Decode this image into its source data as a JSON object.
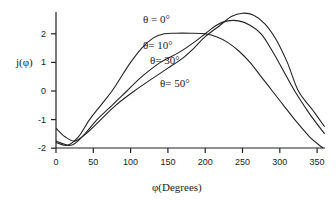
{
  "chart_data": {
    "type": "line",
    "title": "",
    "xlabel": "φ(Degrees)",
    "ylabel": "j(φ)",
    "xlim": [
      0,
      360
    ],
    "ylim": [
      -2,
      2.8
    ],
    "x_ticks": [
      0,
      50,
      100,
      150,
      200,
      250,
      300,
      350
    ],
    "y_ticks": [
      -2,
      -1,
      0,
      1,
      2
    ],
    "grid": false,
    "legend": "inline labels",
    "series": [
      {
        "name": "θ = 0°",
        "label_pos": [
          143,
          23
        ],
        "x": [
          0,
          15,
          30,
          45,
          60,
          75,
          90,
          100,
          115,
          130,
          145,
          160,
          180,
          200,
          215,
          230,
          245,
          260,
          275,
          290,
          305,
          320,
          340,
          358
        ],
        "values": [
          -1.8,
          -1.9,
          -1.6,
          -1.0,
          -0.5,
          0.0,
          0.6,
          1.0,
          1.5,
          1.85,
          2.0,
          2.02,
          2.02,
          2.0,
          1.9,
          1.7,
          1.4,
          1.0,
          0.5,
          0.0,
          -0.5,
          -1.0,
          -1.6,
          -2.0
        ]
      },
      {
        "name": "θ= 10°",
        "label_pos": [
          143,
          49
        ],
        "x": [
          0,
          20,
          35,
          55,
          75,
          95,
          115,
          140,
          165,
          185,
          200,
          215,
          230,
          245,
          260,
          275,
          290,
          305,
          320,
          340,
          360
        ],
        "values": [
          -1.75,
          -1.9,
          -1.6,
          -1.0,
          -0.5,
          0.0,
          0.5,
          1.0,
          1.35,
          1.7,
          2.0,
          2.3,
          2.45,
          2.45,
          2.3,
          2.0,
          1.4,
          0.7,
          0.0,
          -0.8,
          -1.5
        ]
      },
      {
        "name": "θ= 30°",
        "label_pos": [
          150,
          64
        ],
        "x": [],
        "values": []
      },
      {
        "name": "θ= 50°",
        "label_pos": [
          160,
          87
        ],
        "x": [
          0,
          12,
          25,
          40,
          60,
          80,
          105,
          130,
          150,
          170,
          185,
          200,
          220,
          235,
          250,
          265,
          280,
          295,
          310,
          325,
          345,
          360
        ],
        "values": [
          -1.3,
          -1.6,
          -1.75,
          -1.5,
          -1.0,
          -0.5,
          0.0,
          0.45,
          0.8,
          1.15,
          1.5,
          1.9,
          2.3,
          2.6,
          2.72,
          2.65,
          2.35,
          1.8,
          1.0,
          0.0,
          -0.7,
          -1.25
        ]
      }
    ]
  }
}
